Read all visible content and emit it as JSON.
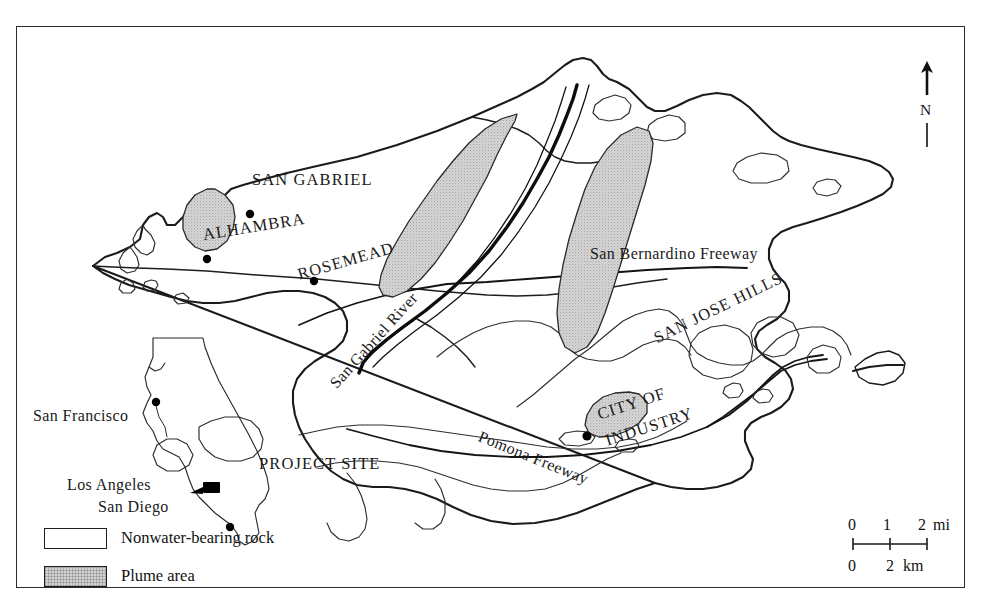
{
  "figure": {
    "frame_border_color": "#2b2b2b",
    "background_color": "#ffffff"
  },
  "map_labels": {
    "san_gabriel": "SAN GABRIEL",
    "alhambra": "ALHAMBRA",
    "rosemead": "ROSEMEAD",
    "san_gabriel_river": "San Gabriel River",
    "san_bernardino_freeway": "San Bernardino Freeway",
    "pomona_freeway": "Pomona Freeway",
    "san_jose_hills": "SAN JOSE HILLS",
    "city_of_industry_line1": "CITY OF",
    "city_of_industry_line2": "INDUSTRY",
    "project_site": "PROJECT SITE"
  },
  "inset": {
    "san_francisco": "San Francisco",
    "los_angeles": "Los Angeles",
    "san_diego": "San Diego"
  },
  "legend": {
    "items": [
      {
        "swatch": "white-rect",
        "label": "Nonwater-bearing rock",
        "fill": "#ffffff"
      },
      {
        "swatch": "stipple-rect",
        "label": "Plume area",
        "fill": "#d2d2d2"
      }
    ]
  },
  "scale_bar": {
    "miles": {
      "ticks": [
        "0",
        "1",
        "2"
      ],
      "unit": "mi"
    },
    "kilometers": {
      "ticks": [
        "0",
        "2"
      ],
      "unit": "km"
    }
  },
  "compass": {
    "direction_label": "N",
    "icon": "north-arrow-icon"
  },
  "colors": {
    "plume_fill": "#d2d2d2",
    "outline": "#1b1b1b",
    "hill_outline": "#2e2e2e",
    "river": "#0d0d0d"
  }
}
